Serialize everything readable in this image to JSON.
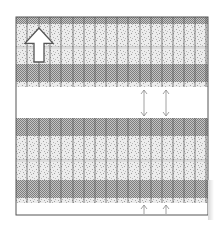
{
  "diagram": {
    "type": "banded-grid-pattern",
    "frame": {
      "x": 16,
      "y": 17,
      "width": 192,
      "height": 198,
      "stroke": "#555555"
    },
    "colors": {
      "checker_dark": "#8a8a8a",
      "checker_light": "#c4c4c4",
      "stipple_bg": "#e6e6e6",
      "stipple_dot": "#9a9a9a",
      "gridline": "#555555",
      "gap": "#ffffff",
      "arrow_stroke": "#555555"
    },
    "bands": [
      {
        "kind": "checker",
        "y": 17,
        "h": 7
      },
      {
        "kind": "stipple",
        "y": 24,
        "h": 23
      },
      {
        "kind": "divider",
        "y": 47,
        "h": 2
      },
      {
        "kind": "stipple",
        "y": 49,
        "h": 15
      },
      {
        "kind": "checker",
        "y": 64,
        "h": 18
      },
      {
        "kind": "stipple",
        "y": 82,
        "h": 5
      },
      {
        "kind": "gap",
        "y": 87,
        "h": 31
      },
      {
        "kind": "checker",
        "y": 118,
        "h": 18
      },
      {
        "kind": "stipple",
        "y": 136,
        "h": 24
      },
      {
        "kind": "divider",
        "y": 160,
        "h": 2
      },
      {
        "kind": "stipple",
        "y": 162,
        "h": 18
      },
      {
        "kind": "checker",
        "y": 180,
        "h": 18
      },
      {
        "kind": "stipple",
        "y": 198,
        "h": 5
      },
      {
        "kind": "gap",
        "y": 203,
        "h": 12
      }
    ],
    "vertical_gridlines_x": [
      27,
      39,
      50,
      61,
      73,
      84,
      95,
      106,
      117,
      128,
      140,
      151,
      162,
      173,
      184,
      195,
      206
    ],
    "gridline_y_ranges": [
      [
        17,
        87
      ],
      [
        118,
        203
      ]
    ],
    "icons": [
      {
        "name": "large-up-arrow-icon",
        "x": 25,
        "y": 28,
        "w": 28,
        "h": 34
      },
      {
        "name": "double-arrow-vertical-icon",
        "x": 144,
        "y": 90,
        "h": 26
      },
      {
        "name": "double-arrow-vertical-icon",
        "x": 166,
        "y": 90,
        "h": 26
      },
      {
        "name": "small-up-arrow-icon",
        "x": 144,
        "y": 205,
        "h": 9
      },
      {
        "name": "small-up-arrow-icon",
        "x": 166,
        "y": 205,
        "h": 9
      }
    ]
  }
}
